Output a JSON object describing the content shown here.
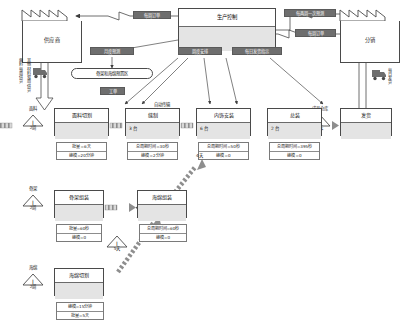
{
  "diagram": {
    "type": "value-stream-map"
  },
  "colors": {
    "chip_fill": "#6e6e6e",
    "chip_text": "#ffffff",
    "box_stroke": "#4a4a4a",
    "box_fill": "#ffffff",
    "body_fill": "#e4e4e4",
    "arrow": "#4a4a4a",
    "push_arrow": "#8e8e8e"
  },
  "external": {
    "supplier": {
      "label": "供应商"
    },
    "customer": {
      "label": "分销"
    },
    "supplier_ship_note_line1": "面料每周供货",
    "supplier_ship_note_line2": "其他材料双周供货",
    "customer_ship_note": "每日发货"
  },
  "control": {
    "label": "生产控制",
    "body": ""
  },
  "info_flows": [
    {
      "id": "weekly-order-supplier",
      "label": "每周订单"
    },
    {
      "id": "biweekly-forecast",
      "label": "每两周一次预测"
    },
    {
      "id": "weekly-order-customer",
      "label": "每周订单"
    },
    {
      "id": "monthly-forecast",
      "label": "月度预测"
    },
    {
      "id": "weekly-schedule",
      "label": "周度安排"
    },
    {
      "id": "daily-ship-instruction",
      "label": "每日发货指示"
    },
    {
      "id": "work-order",
      "label": "工单"
    }
  ],
  "supermarket": {
    "label": "骨架和海绵预置区"
  },
  "main_line": {
    "inventories": [
      {
        "id": "inv-fabric",
        "top": "面料",
        "bottom": "2周"
      },
      {
        "id": "inv-after-cut",
        "top": "",
        "bottom": "1天"
      },
      {
        "id": "inv-after-sew",
        "top": "",
        "bottom": "3天"
      },
      {
        "id": "inv-after-interior",
        "top": "",
        "bottom": "1.5天"
      },
      {
        "id": "inv-finished",
        "top": "成品仓库",
        "bottom": "3天"
      }
    ],
    "processes": [
      {
        "id": "proc-fabric-cut",
        "name": "面料切割",
        "body": "",
        "data": [
          "批量=6天",
          "换模=20分钟"
        ]
      },
      {
        "id": "proc-sewing",
        "name": "缝制",
        "body": "3 台",
        "data": [
          "总周期时间=30秒",
          "换模=2分钟"
        ]
      },
      {
        "id": "proc-interior",
        "name": "内饰安装",
        "body": "6 台",
        "data": [
          "总周期时间=50秒",
          "换模=0"
        ]
      },
      {
        "id": "proc-assembly",
        "name": "总装",
        "body": "2 台",
        "data": [
          "总周期时间=395秒",
          "换模=0"
        ]
      },
      {
        "id": "proc-shipping",
        "name": "发货",
        "body": "",
        "data": []
      }
    ],
    "transfer_label": "自动传输"
  },
  "branch_frame": {
    "inventory": {
      "top": "骨架",
      "bottom": "2周"
    },
    "process_a": {
      "id": "proc-frame-assembly",
      "name": "骨架组装",
      "body": "",
      "data": [
        "批量=60秒",
        "换模=0"
      ]
    },
    "mid_inventory": {
      "top": "",
      "bottom": "5天"
    },
    "process_b": {
      "id": "proc-foam-assembly",
      "name": "海绵组装",
      "body": "",
      "data": [
        "总周期时间=60秒",
        "换模=0"
      ]
    },
    "out_inventory": {
      "top": "",
      "bottom": "5天"
    },
    "to_line_label": "4天"
  },
  "branch_foam": {
    "inventory": {
      "top": "海绵",
      "bottom": "2周"
    },
    "process": {
      "id": "proc-foam-cut",
      "name": "海绵切割",
      "body": "",
      "data": [
        "换模=15分钟",
        "批量=5天"
      ]
    }
  }
}
